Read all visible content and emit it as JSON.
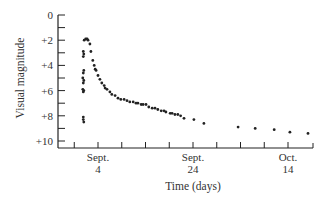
{
  "chart_data": {
    "type": "scatter",
    "title": "",
    "xlabel": "Time (days)",
    "ylabel": "Visual magnitude",
    "y_inverted": true,
    "ylim": [
      0,
      10
    ],
    "yticks": [
      {
        "value": 0,
        "label": "0"
      },
      {
        "value": 2,
        "label": "+2"
      },
      {
        "value": 4,
        "label": "+4"
      },
      {
        "value": 6,
        "label": "+6"
      },
      {
        "value": 8,
        "label": "+8"
      },
      {
        "value": 10,
        "label": "+10"
      }
    ],
    "x_unit": "days from Sept. 4",
    "xlim": [
      -5.5,
      45
    ],
    "xticks": [
      {
        "value": 0,
        "label": [
          "Sept.",
          "4"
        ]
      },
      {
        "value": 20,
        "label": [
          "Sept.",
          "24"
        ]
      },
      {
        "value": 40,
        "label": [
          "Oct.",
          "14"
        ]
      }
    ],
    "x_minor_tick_step": 5,
    "y_minor_tick_step": 1,
    "grid": false,
    "series": [
      {
        "name": "Nova light curve",
        "points": [
          [
            -3.1,
            8.3
          ],
          [
            -3.1,
            8.1
          ],
          [
            -3.0,
            8.5
          ],
          [
            -3.1,
            6.1
          ],
          [
            -3.0,
            6.0
          ],
          [
            -3.2,
            5.9
          ],
          [
            -3.1,
            5.4
          ],
          [
            -3.0,
            5.2
          ],
          [
            -3.2,
            5.0
          ],
          [
            -3.1,
            4.6
          ],
          [
            -3.0,
            4.4
          ],
          [
            -3.1,
            3.3
          ],
          [
            -3.0,
            3.1
          ],
          [
            -3.1,
            2.9
          ],
          [
            -2.9,
            2.0
          ],
          [
            -2.6,
            1.9
          ],
          [
            -2.3,
            1.9
          ],
          [
            -2.1,
            2.0
          ],
          [
            -1.7,
            2.3
          ],
          [
            -1.5,
            2.9
          ],
          [
            -1.1,
            3.6
          ],
          [
            -0.8,
            4.0
          ],
          [
            -0.6,
            4.3
          ],
          [
            -0.4,
            4.4
          ],
          [
            0.0,
            4.8
          ],
          [
            0.4,
            5.1
          ],
          [
            0.8,
            5.4
          ],
          [
            1.3,
            5.6
          ],
          [
            1.5,
            5.8
          ],
          [
            1.9,
            5.9
          ],
          [
            2.5,
            6.1
          ],
          [
            2.9,
            6.3
          ],
          [
            3.6,
            6.4
          ],
          [
            4.2,
            6.6
          ],
          [
            4.8,
            6.7
          ],
          [
            5.5,
            6.7
          ],
          [
            6.1,
            6.8
          ],
          [
            6.7,
            6.9
          ],
          [
            7.4,
            6.9
          ],
          [
            8.0,
            7.0
          ],
          [
            8.4,
            7.0
          ],
          [
            9.1,
            7.1
          ],
          [
            9.5,
            7.1
          ],
          [
            10.1,
            7.1
          ],
          [
            10.7,
            7.3
          ],
          [
            11.4,
            7.4
          ],
          [
            12.0,
            7.4
          ],
          [
            12.6,
            7.5
          ],
          [
            13.3,
            7.6
          ],
          [
            13.9,
            7.6
          ],
          [
            14.3,
            7.7
          ],
          [
            15.2,
            7.8
          ],
          [
            15.6,
            7.8
          ],
          [
            16.2,
            7.9
          ],
          [
            16.8,
            7.9
          ],
          [
            17.4,
            8.0
          ],
          [
            18.1,
            8.2
          ],
          [
            20.2,
            8.3
          ],
          [
            22.3,
            8.6
          ],
          [
            29.5,
            8.9
          ],
          [
            33.1,
            9.0
          ],
          [
            37.1,
            9.1
          ],
          [
            40.4,
            9.3
          ],
          [
            44.2,
            9.4
          ]
        ]
      }
    ]
  },
  "colors": {
    "ink": "#222222",
    "background": "#ffffff"
  }
}
